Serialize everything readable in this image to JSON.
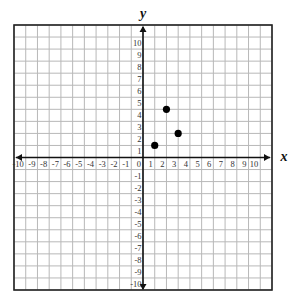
{
  "chart_data": {
    "type": "scatter",
    "title": "",
    "xlabel": "x",
    "ylabel": "y",
    "xlim": [
      -11,
      11
    ],
    "ylim": [
      -11,
      11
    ],
    "grid": true,
    "x_ticks": [
      -10,
      -9,
      -8,
      -7,
      -6,
      -5,
      -4,
      -3,
      -2,
      -1,
      0,
      1,
      2,
      3,
      4,
      5,
      6,
      7,
      8,
      9,
      10
    ],
    "y_ticks": [
      -10,
      -9,
      -8,
      -7,
      -6,
      -5,
      -4,
      -3,
      -2,
      -1,
      1,
      2,
      3,
      4,
      5,
      6,
      7,
      8,
      9,
      10
    ],
    "points": [
      {
        "x": 1,
        "y": 1
      },
      {
        "x": 2,
        "y": 4
      },
      {
        "x": 3,
        "y": 2
      }
    ],
    "legend": null
  },
  "colors": {
    "grid": "#b8b8b8",
    "border": "#222222",
    "axis": "#111111",
    "point": "#000000",
    "tick_text": "#333333"
  },
  "labels": {
    "x_axis": "x",
    "y_axis": "y"
  }
}
